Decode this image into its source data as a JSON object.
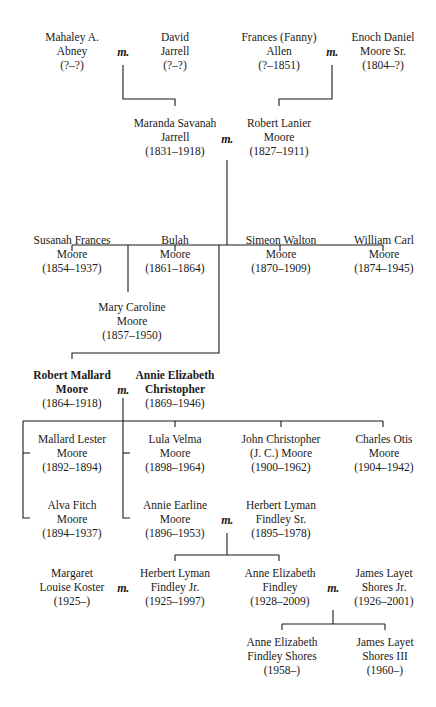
{
  "marriage_symbol": "m.",
  "people": {
    "mahaley_abney": {
      "name_lines": [
        "Mahaley A.",
        "Abney"
      ],
      "dates": "(?–?)"
    },
    "david_jarrell": {
      "name_lines": [
        "David",
        "Jarrell"
      ],
      "dates": "(?–?)"
    },
    "frances_allen": {
      "name_lines": [
        "Frances (Fanny)",
        "Allen"
      ],
      "dates": "(?–1851)"
    },
    "enoch_moore_sr": {
      "name_lines": [
        "Enoch Daniel",
        "Moore Sr."
      ],
      "dates": "(1804–?)"
    },
    "maranda_jarrell": {
      "name_lines": [
        "Maranda Savanah",
        "Jarrell"
      ],
      "dates": "(1831–1918)"
    },
    "robert_lanier_moore": {
      "name_lines": [
        "Robert Lanier",
        "Moore"
      ],
      "dates": "(1827–1911)"
    },
    "susanah_moore": {
      "name_lines": [
        "Susanah Frances",
        "Moore"
      ],
      "dates": "(1854–1937)"
    },
    "bulah_moore": {
      "name_lines": [
        "Bulah",
        "Moore"
      ],
      "dates": "(1861–1864)"
    },
    "simeon_moore": {
      "name_lines": [
        "Simeon Walton",
        "Moore"
      ],
      "dates": "(1870–1909)"
    },
    "william_moore": {
      "name_lines": [
        "William Carl",
        "Moore"
      ],
      "dates": "(1874–1945)"
    },
    "mary_moore": {
      "name_lines": [
        "Mary Caroline",
        "Moore"
      ],
      "dates": "(1857–1950)"
    },
    "robert_mallard_moore": {
      "name_lines": [
        "Robert Mallard",
        "Moore"
      ],
      "dates": "(1864–1918)",
      "bold": true
    },
    "annie_christopher": {
      "name_lines": [
        "Annie Elizabeth",
        "Christopher"
      ],
      "dates": "(1869–1946)",
      "bold": true
    },
    "mallard_moore": {
      "name_lines": [
        "Mallard Lester",
        "Moore"
      ],
      "dates": "(1892–1894)"
    },
    "lula_moore": {
      "name_lines": [
        "Lula Velma",
        "Moore"
      ],
      "dates": "(1898–1964)"
    },
    "john_moore": {
      "name_lines": [
        "John Christopher",
        "(J. C.) Moore"
      ],
      "dates": "(1900–1962)"
    },
    "charles_moore": {
      "name_lines": [
        "Charles Otis",
        "Moore"
      ],
      "dates": "(1904–1942)"
    },
    "alva_moore": {
      "name_lines": [
        "Alva Fitch",
        "Moore"
      ],
      "dates": "(1894–1937)"
    },
    "annie_earline_moore": {
      "name_lines": [
        "Annie Earline",
        "Moore"
      ],
      "dates": "(1896–1953)"
    },
    "herbert_findley_sr": {
      "name_lines": [
        "Herbert Lyman",
        "Findley Sr."
      ],
      "dates": "(1895–1978)"
    },
    "margaret_koster": {
      "name_lines": [
        "Margaret",
        "Louise Koster"
      ],
      "dates": "(1925–)"
    },
    "herbert_findley_jr": {
      "name_lines": [
        "Herbert Lyman",
        "Findley Jr."
      ],
      "dates": "(1925–1997)"
    },
    "anne_findley": {
      "name_lines": [
        "Anne Elizabeth",
        "Findley"
      ],
      "dates": "(1928–2009)"
    },
    "james_shores_jr": {
      "name_lines": [
        "James Layet",
        "Shores Jr."
      ],
      "dates": "(1926–2001)"
    },
    "anne_shores": {
      "name_lines": [
        "Anne Elizabeth",
        "Findley Shores"
      ],
      "dates": "(1958–)"
    },
    "james_shores_iii": {
      "name_lines": [
        "James Layet",
        "Shores III"
      ],
      "dates": "(1960–)"
    }
  },
  "marriages": [
    {
      "between": [
        "mahaley_abney",
        "david_jarrell"
      ]
    },
    {
      "between": [
        "frances_allen",
        "enoch_moore_sr"
      ]
    },
    {
      "between": [
        "maranda_jarrell",
        "robert_lanier_moore"
      ]
    },
    {
      "between": [
        "robert_mallard_moore",
        "annie_christopher"
      ]
    },
    {
      "between": [
        "annie_earline_moore",
        "herbert_findley_sr"
      ]
    },
    {
      "between": [
        "margaret_koster",
        "herbert_findley_jr"
      ]
    },
    {
      "between": [
        "anne_findley",
        "james_shores_jr"
      ]
    }
  ]
}
